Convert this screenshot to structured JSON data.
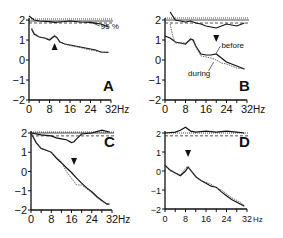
{
  "figure": {
    "width": 283,
    "height": 238
  },
  "chart_data": [
    {
      "type": "line",
      "panel": "A",
      "xlabel": "Hz",
      "xticks": [
        0,
        8,
        16,
        24,
        32
      ],
      "yticks": [
        2,
        1,
        0,
        -1,
        -2
      ],
      "xlim": [
        0,
        32
      ],
      "ylim": [
        -2,
        2
      ],
      "annotations": [
        {
          "text": "95 %",
          "x": 28,
          "y": 1.75
        },
        {
          "marker": "arrow-up",
          "x": 10,
          "y": 0.65
        }
      ],
      "threshold_lines": [
        2.05,
        1.95,
        1.85
      ],
      "series": [
        {
          "name": "upper-trace",
          "style": "solid",
          "x": [
            0,
            2,
            4,
            8,
            10,
            12,
            16,
            20,
            24,
            28,
            31
          ],
          "y": [
            2.2,
            2.0,
            1.95,
            1.92,
            1.88,
            1.9,
            1.95,
            1.9,
            1.88,
            1.8,
            1.65
          ]
        },
        {
          "name": "before",
          "style": "solid",
          "x": [
            1,
            2,
            4,
            6,
            8,
            9,
            10,
            11,
            12,
            14,
            16,
            20,
            24,
            26,
            28,
            31
          ],
          "y": [
            1.55,
            1.3,
            1.15,
            1.1,
            1.0,
            1.1,
            1.2,
            1.1,
            0.9,
            0.8,
            0.75,
            0.65,
            0.55,
            0.5,
            0.4,
            0.38
          ]
        },
        {
          "name": "during",
          "style": "dotted",
          "x": [
            1,
            2,
            4,
            6,
            8,
            9,
            10,
            11,
            12,
            14,
            16,
            20,
            24,
            26,
            28,
            31
          ],
          "y": [
            1.6,
            1.35,
            1.15,
            1.1,
            1.05,
            1.15,
            1.25,
            1.1,
            0.9,
            0.8,
            0.72,
            0.62,
            0.5,
            0.45,
            0.4,
            0.38
          ]
        }
      ]
    },
    {
      "type": "line",
      "panel": "B",
      "xlabel": "Hz",
      "xticks": [
        0,
        8,
        16,
        24,
        32
      ],
      "yticks": [
        2,
        1,
        0,
        -1,
        -2
      ],
      "xlim": [
        0,
        32
      ],
      "ylim": [
        -2,
        2
      ],
      "legend": [
        "before",
        "during"
      ],
      "annotations": [
        {
          "marker": "arrow-down",
          "x": 20,
          "y": 1.1
        }
      ],
      "threshold_lines": [
        2.1,
        2.0,
        1.85
      ],
      "series": [
        {
          "name": "upper-trace",
          "style": "solid",
          "x": [
            2,
            4,
            6,
            8,
            10,
            12,
            14,
            16,
            18,
            20,
            22,
            24,
            26,
            28,
            31
          ],
          "y": [
            2.4,
            2.0,
            1.95,
            1.9,
            1.95,
            1.85,
            1.8,
            1.7,
            1.65,
            1.6,
            1.7,
            1.8,
            1.75,
            1.7,
            1.85
          ]
        },
        {
          "name": "before",
          "style": "solid",
          "x": [
            0,
            2,
            4,
            6,
            8,
            10,
            11,
            12,
            14,
            16,
            18,
            20,
            22,
            24,
            26,
            28,
            31
          ],
          "y": [
            1.2,
            1.1,
            0.9,
            0.85,
            0.8,
            1.05,
            1.0,
            0.7,
            0.3,
            0.25,
            0.25,
            0.3,
            0.1,
            -0.1,
            -0.2,
            -0.3,
            -0.45
          ]
        },
        {
          "name": "during",
          "style": "dotted",
          "x": [
            2,
            3,
            4,
            6,
            8,
            10,
            11,
            12,
            14,
            16,
            18,
            20,
            22,
            24,
            26,
            28,
            31
          ],
          "y": [
            1.8,
            1.2,
            0.85,
            0.85,
            0.85,
            1.0,
            0.95,
            0.65,
            0.2,
            0.15,
            0.1,
            0.0,
            -0.15,
            -0.2,
            -0.3,
            -0.4,
            -0.45
          ]
        }
      ]
    },
    {
      "type": "line",
      "panel": "C",
      "xlabel": "Hz",
      "xticks": [
        0,
        8,
        16,
        24,
        32
      ],
      "yticks": [
        2,
        1,
        0,
        -1,
        -2
      ],
      "xlim": [
        0,
        32
      ],
      "ylim": [
        -2,
        2
      ],
      "annotations": [
        {
          "marker": "arrow-down",
          "x": 17,
          "y": 0.55
        }
      ],
      "threshold_lines": [
        2.05,
        2.0,
        1.85
      ],
      "series": [
        {
          "name": "upper-trace",
          "style": "solid",
          "x": [
            0,
            4,
            8,
            10,
            12,
            14,
            16,
            17,
            18,
            20,
            24,
            28,
            31
          ],
          "y": [
            2.0,
            1.9,
            1.85,
            1.75,
            1.7,
            1.65,
            1.5,
            1.55,
            1.7,
            1.95,
            2.0,
            2.15,
            2.05
          ]
        },
        {
          "name": "before",
          "style": "solid",
          "x": [
            0,
            2,
            4,
            6,
            8,
            10,
            12,
            14,
            16,
            18,
            20,
            22,
            24,
            26,
            28,
            30,
            31
          ],
          "y": [
            2.0,
            1.5,
            1.2,
            1.1,
            1.0,
            0.7,
            0.45,
            0.2,
            -0.05,
            -0.35,
            -0.6,
            -0.85,
            -1.05,
            -1.3,
            -1.5,
            -1.7,
            -1.7
          ]
        },
        {
          "name": "during",
          "style": "dotted",
          "x": [
            0,
            2,
            4,
            6,
            8,
            10,
            12,
            14,
            16,
            18,
            20,
            22,
            24,
            26,
            28,
            30,
            31
          ],
          "y": [
            2.0,
            1.55,
            1.2,
            1.1,
            1.0,
            0.75,
            0.5,
            0.0,
            -0.35,
            -0.7,
            -0.7,
            -0.9,
            -1.1,
            -1.35,
            -1.55,
            -1.65,
            -1.7
          ]
        }
      ]
    },
    {
      "type": "line",
      "panel": "D",
      "xlabel": "Hz",
      "xticks": [
        0,
        8,
        16,
        24,
        32
      ],
      "yticks": [
        2,
        1,
        0,
        -1,
        -2
      ],
      "xlim": [
        0,
        32
      ],
      "ylim": [
        -2,
        2
      ],
      "annotations": [
        {
          "marker": "arrow-down",
          "x": 9,
          "y": 0.95
        }
      ],
      "threshold_lines": [
        2.0,
        1.85
      ],
      "series": [
        {
          "name": "upper-trace",
          "style": "solid",
          "x": [
            0,
            4,
            6,
            8,
            10,
            12,
            16,
            20,
            24,
            28,
            31
          ],
          "y": [
            2.0,
            2.05,
            2.15,
            2.3,
            2.1,
            2.05,
            2.1,
            2.05,
            2.1,
            2.05,
            2.0
          ]
        },
        {
          "name": "before",
          "style": "solid",
          "x": [
            0,
            2,
            4,
            6,
            8,
            9,
            10,
            12,
            14,
            16,
            18,
            20,
            22,
            24,
            26,
            28,
            31
          ],
          "y": [
            0.3,
            0.05,
            -0.1,
            -0.25,
            0.0,
            0.2,
            0.05,
            -0.3,
            -0.5,
            -0.65,
            -0.8,
            -0.85,
            -1.1,
            -1.3,
            -1.5,
            -1.65,
            -1.85
          ]
        },
        {
          "name": "during",
          "style": "dotted",
          "x": [
            0,
            2,
            4,
            6,
            8,
            9,
            10,
            12,
            14,
            16,
            18,
            20,
            22,
            24,
            26,
            28,
            31
          ],
          "y": [
            0.3,
            0.0,
            -0.1,
            -0.2,
            0.15,
            0.25,
            0.05,
            -0.3,
            -0.5,
            -0.6,
            -0.7,
            -0.9,
            -1.0,
            -1.2,
            -1.4,
            -1.55,
            -1.8
          ]
        }
      ]
    }
  ],
  "panels": [
    {
      "label": "A",
      "ox": 29,
      "xw": 82,
      "y2": 20,
      "ym2": 100,
      "ticklabel_size": 12,
      "tick_fontsize": 11
    },
    {
      "label": "B",
      "ox": 165,
      "xw": 82,
      "y2": 20,
      "ym2": 100,
      "ticklabel_size": 12,
      "tick_fontsize": 11
    },
    {
      "label": "C",
      "ox": 31,
      "xw": 81,
      "y2": 133,
      "ym2": 210,
      "ticklabel_size": 12,
      "tick_fontsize": 11
    },
    {
      "label": "D",
      "ox": 165,
      "xw": 82,
      "y2": 133,
      "ym2": 209,
      "ticklabel_size": 12,
      "tick_fontsize": 9
    }
  ],
  "labels": {
    "hz": "Hz",
    "pct95": "95 %",
    "before": "before",
    "during": "during"
  }
}
